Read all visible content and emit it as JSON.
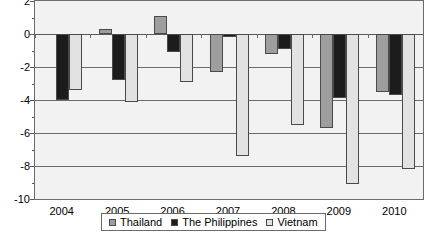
{
  "chart_data": {
    "type": "bar",
    "title": "",
    "subtitle": "",
    "xlabel": "",
    "ylabel": "",
    "categories": [
      "2004",
      "2005",
      "2006",
      "2007",
      "2008",
      "2009",
      "2010"
    ],
    "series": [
      {
        "name": "Thailand",
        "color": "#9e9e9e",
        "values": [
          0.0,
          0.3,
          1.1,
          -2.3,
          -1.2,
          -5.7,
          -3.5
        ]
      },
      {
        "name": "The Philippines",
        "color": "#1c1c1c",
        "values": [
          -4.0,
          -2.8,
          -1.1,
          -0.2,
          -0.9,
          -3.9,
          -3.7
        ]
      },
      {
        "name": "Vietnam",
        "color": "#e2e2e2",
        "values": [
          -3.4,
          -4.1,
          -2.9,
          -7.4,
          -5.5,
          -9.1,
          -8.2
        ]
      }
    ],
    "ylim": [
      -10,
      2
    ],
    "yticks": [
      2,
      0,
      -2,
      -4,
      -6,
      -8,
      -10
    ],
    "ytick_labels": [
      "2",
      "0",
      "-2",
      "-4",
      "-6",
      "-8",
      "-10"
    ],
    "grid": true,
    "grid_axis": "y",
    "legend_position": "bottom",
    "plot_background": "#f2f2f2"
  },
  "legend": {
    "items": [
      {
        "label": "Thailand"
      },
      {
        "label": "The Philippines"
      },
      {
        "label": "Vietnam"
      }
    ]
  }
}
